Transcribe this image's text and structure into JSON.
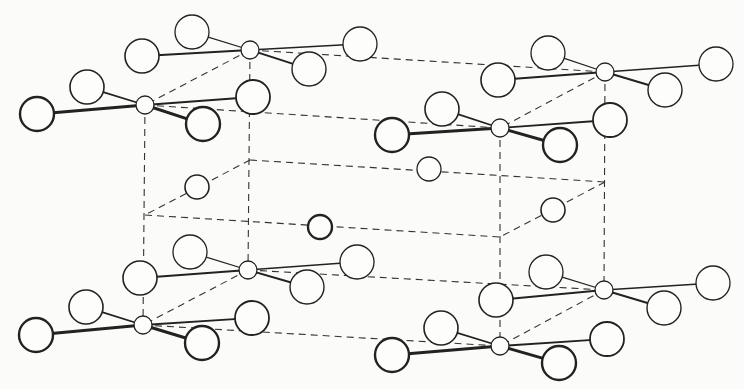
{
  "diagram": {
    "type": "crystal-structure-unit-cell",
    "colors": {
      "line": "#222222",
      "dash": "#333333",
      "background": "#fbfbfa",
      "atom_fill": "#fdfdfc"
    },
    "cell_edges": [
      [
        250,
        50,
        605,
        72
      ],
      [
        145,
        105,
        500,
        128
      ],
      [
        250,
        50,
        145,
        105
      ],
      [
        605,
        72,
        500,
        128
      ],
      [
        248,
        270,
        604,
        290
      ],
      [
        143,
        325,
        500,
        346
      ],
      [
        248,
        270,
        143,
        325
      ],
      [
        604,
        290,
        500,
        346
      ],
      [
        250,
        50,
        248,
        270
      ],
      [
        145,
        105,
        143,
        325
      ],
      [
        605,
        72,
        604,
        290
      ],
      [
        500,
        128,
        500,
        346
      ],
      [
        250,
        160,
        605,
        182
      ],
      [
        145,
        215,
        500,
        237
      ],
      [
        250,
        160,
        145,
        215
      ],
      [
        605,
        182,
        500,
        237
      ]
    ],
    "groups": [
      {
        "name": "top-back-left",
        "center": [
          250,
          50
        ],
        "ligands": [
          [
            192,
            32,
            17,
            1.3
          ],
          [
            142,
            56,
            17,
            1.6
          ],
          [
            360,
            44,
            17,
            1.3
          ],
          [
            309,
            69,
            17,
            1.4
          ]
        ],
        "bond_widths": [
          1.3,
          2,
          1.5,
          2
        ]
      },
      {
        "name": "top-front-left",
        "center": [
          145,
          105
        ],
        "ligands": [
          [
            87,
            87,
            17,
            1.6
          ],
          [
            37,
            114,
            17,
            2.4
          ],
          [
            253,
            97,
            17,
            1.8
          ],
          [
            203,
            124,
            17,
            2.4
          ]
        ],
        "bond_widths": [
          1.8,
          3,
          1.8,
          3
        ]
      },
      {
        "name": "top-back-right",
        "center": [
          605,
          72
        ],
        "ligands": [
          [
            548,
            53,
            17,
            1.3
          ],
          [
            498,
            80,
            17,
            1.6
          ],
          [
            716,
            64,
            17,
            1.3
          ],
          [
            665,
            90,
            17,
            1.4
          ]
        ],
        "bond_widths": [
          1.3,
          2,
          1.5,
          2
        ]
      },
      {
        "name": "top-front-right",
        "center": [
          500,
          128
        ],
        "ligands": [
          [
            442,
            109,
            17,
            1.6
          ],
          [
            392,
            135,
            17,
            2.4
          ],
          [
            610,
            120,
            17,
            1.8
          ],
          [
            560,
            145,
            17,
            2.4
          ]
        ],
        "bond_widths": [
          1.8,
          3,
          1.8,
          3
        ]
      },
      {
        "name": "bottom-back-left",
        "center": [
          248,
          270
        ],
        "ligands": [
          [
            190,
            252,
            17,
            1.3
          ],
          [
            140,
            278,
            17,
            1.6
          ],
          [
            357,
            262,
            17,
            1.3
          ],
          [
            307,
            287,
            17,
            1.4
          ]
        ],
        "bond_widths": [
          1.3,
          2,
          1.5,
          2
        ]
      },
      {
        "name": "bottom-front-left",
        "center": [
          143,
          325
        ],
        "ligands": [
          [
            86,
            307,
            17,
            1.6
          ],
          [
            36,
            335,
            17,
            2.4
          ],
          [
            252,
            318,
            17,
            1.8
          ],
          [
            202,
            343,
            17,
            2.4
          ]
        ],
        "bond_widths": [
          1.8,
          3,
          1.8,
          3
        ]
      },
      {
        "name": "bottom-back-right",
        "center": [
          604,
          290
        ],
        "ligands": [
          [
            546,
            272,
            17,
            1.3
          ],
          [
            496,
            300,
            17,
            1.6
          ],
          [
            713,
            283,
            17,
            1.3
          ],
          [
            664,
            308,
            17,
            1.4
          ]
        ],
        "bond_widths": [
          1.3,
          2,
          1.5,
          2
        ]
      },
      {
        "name": "bottom-front-right",
        "center": [
          500,
          346
        ],
        "ligands": [
          [
            441,
            328,
            17,
            1.6
          ],
          [
            392,
            355,
            17,
            2.4
          ],
          [
            607,
            339,
            17,
            1.8
          ],
          [
            559,
            363,
            17,
            2.4
          ]
        ],
        "bond_widths": [
          1.8,
          3,
          1.8,
          3
        ]
      }
    ],
    "center_atom_radius": 9,
    "middle_atoms": [
      [
        197,
        187,
        12,
        1.6
      ],
      [
        429,
        169,
        12,
        1.3
      ],
      [
        320,
        227,
        12,
        2.4
      ],
      [
        553,
        210,
        12,
        1.6
      ]
    ]
  }
}
